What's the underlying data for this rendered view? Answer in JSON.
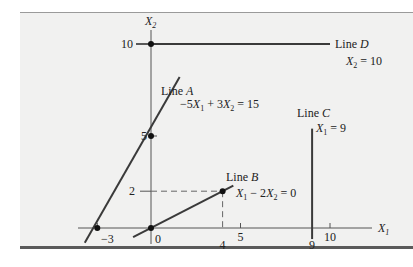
{
  "diagram": {
    "type": "linear-constraint-lines",
    "axes": {
      "x_label": "X",
      "x_label_sub": "1",
      "y_label": "X",
      "y_label_sub": "2",
      "x_ticks": [
        {
          "value": -3,
          "label": "−3"
        },
        {
          "value": 0,
          "label": "0"
        },
        {
          "value": 4,
          "label": "4"
        },
        {
          "value": 5,
          "label": "5"
        },
        {
          "value": 9,
          "label": "9"
        },
        {
          "value": 10,
          "label": "10"
        }
      ],
      "y_ticks": [
        {
          "value": 2,
          "label": "2"
        },
        {
          "value": 5,
          "label": "5"
        },
        {
          "value": 10,
          "label": "10"
        }
      ]
    },
    "lines": [
      {
        "id": "A",
        "name_prefix": "Line ",
        "name_letter": "A",
        "equation": "−5X₁ + 3X₂ = 15",
        "eq_parts": [
          "−5",
          "X",
          "1",
          " + 3",
          "X",
          "2",
          " = 15"
        ],
        "from": [
          -3.7,
          -0.8
        ],
        "to": [
          1.6,
          8.2
        ]
      },
      {
        "id": "B",
        "name_prefix": "Line ",
        "name_letter": "B",
        "equation": "X₁ − 2X₂ = 0",
        "eq_parts": [
          "",
          "X",
          "1",
          " − 2",
          "X",
          "2",
          " = 0"
        ],
        "from": [
          -1.0,
          -0.5
        ],
        "to": [
          4.6,
          2.3
        ]
      },
      {
        "id": "C",
        "name_prefix": "Line ",
        "name_letter": "C",
        "equation": "X₁ = 9",
        "eq_parts": [
          "",
          "X",
          "1",
          " = 9"
        ],
        "from": [
          9,
          -0.6
        ],
        "to": [
          9,
          5.4
        ]
      },
      {
        "id": "D",
        "name_prefix": "Line ",
        "name_letter": "D",
        "equation": "X₂ = 10",
        "eq_parts": [
          "",
          "X",
          "2",
          " = 10"
        ],
        "from": [
          0,
          10
        ],
        "to": [
          10,
          10
        ]
      }
    ],
    "points": [
      {
        "x": 0,
        "y": 10
      },
      {
        "x": 0,
        "y": 5
      },
      {
        "x": -3,
        "y": 0
      },
      {
        "x": 0,
        "y": 0
      },
      {
        "x": 4,
        "y": 2
      }
    ],
    "guides": [
      {
        "from": [
          0,
          2
        ],
        "to": [
          4,
          2
        ]
      },
      {
        "from": [
          4,
          2
        ],
        "to": [
          4,
          0
        ]
      }
    ]
  }
}
